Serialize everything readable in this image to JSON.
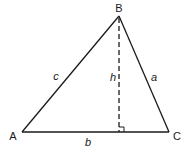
{
  "diagram": {
    "type": "triangle-with-altitude",
    "vertices": {
      "A": {
        "label": "A",
        "x": 22,
        "y": 132
      },
      "B": {
        "label": "B",
        "x": 119,
        "y": 16
      },
      "C": {
        "label": "C",
        "x": 169,
        "y": 132
      }
    },
    "altitude_foot": {
      "x": 119,
      "y": 132
    },
    "sides": {
      "a": {
        "label": "a",
        "between": "B-C"
      },
      "b": {
        "label": "b",
        "between": "A-C"
      },
      "c": {
        "label": "c",
        "between": "A-B"
      }
    },
    "altitude": {
      "label": "h",
      "from": "B",
      "to": "base AC",
      "style": "dashed"
    },
    "right_angle_marker": true,
    "colors": {
      "line": "#1a1a1a",
      "background": "#ffffff"
    }
  }
}
